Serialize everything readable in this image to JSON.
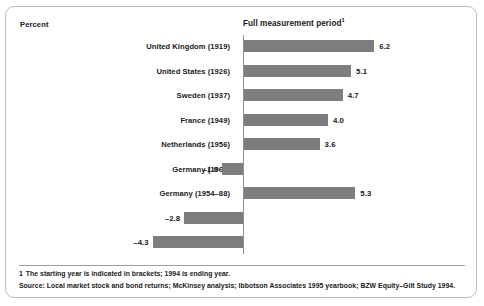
{
  "exhibit": {
    "unit_label": "Percent",
    "footnote_marker": "1",
    "footnote_text": "The starting year is indicated in brackets; 1994 is ending year.",
    "source_text": "Source: Local market stock and bond returns; McKinsey analysis; Ibbotson Associates 1995 yearbook; BZW Equity–Gilt Study 1994.",
    "bar_color": "#7d7d7d",
    "axis_color": "#8e9296",
    "frame_color": "#b9bdc1"
  },
  "chart_data": {
    "type": "bar",
    "orientation": "horizontal",
    "title": "Full measurement period",
    "title_footnote": "1",
    "xlabel": "",
    "ylabel": "Percent",
    "unit": "Percent",
    "grid": false,
    "legend": "none",
    "xlim": [
      -4.3,
      6.2
    ],
    "zero_baseline": true,
    "categories": [
      "United Kingdom (1919)",
      "United States (1926)",
      "Sweden (1937)",
      "France (1949)",
      "Netherlands (1956)",
      "Germany (1967)",
      "Germany (1954–88)",
      "Italy (1960)",
      "Belgium (1949)"
    ],
    "values": [
      6.2,
      5.1,
      4.7,
      4.0,
      3.6,
      -1.0,
      5.3,
      -2.8,
      -4.3
    ],
    "value_labels": [
      "6.2",
      "5.1",
      "4.7",
      "4.0",
      "3.6",
      "–1.0",
      "5.3",
      "–2.8",
      "–4.3"
    ]
  }
}
